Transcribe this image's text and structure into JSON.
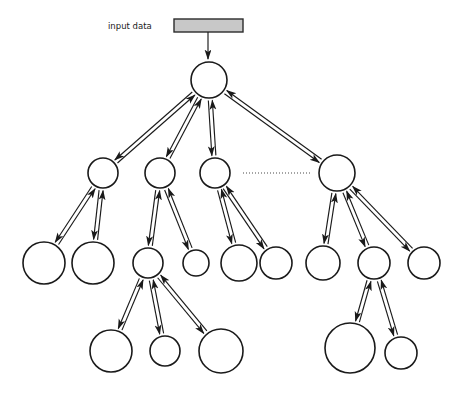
{
  "diagram": {
    "title_label": "input data",
    "colors": {
      "stroke": "#1a1a1a",
      "node_fill": "#ffffff",
      "input_bar_fill": "#c8c8c8",
      "input_bar_stroke": "#2b2b2b",
      "ellipsis_stroke": "#4a4a4a",
      "background": "#ffffff"
    },
    "input_bar": {
      "x": 174,
      "y": 19,
      "width": 69,
      "height": 13
    },
    "feed_arrow": {
      "x1": 208,
      "y1": 32,
      "x2": 208,
      "y2": 59
    },
    "ellipsis": {
      "x1": 243,
      "y1": 173,
      "x2": 311,
      "y2": 173
    },
    "nodes": [
      {
        "id": "root",
        "label": "",
        "cx": 209,
        "cy": 80,
        "r": 18,
        "level": 0
      },
      {
        "id": "l1n1",
        "label": "",
        "cx": 103,
        "cy": 173,
        "r": 15,
        "level": 1
      },
      {
        "id": "l1n2",
        "label": "",
        "cx": 160,
        "cy": 173,
        "r": 15,
        "level": 1
      },
      {
        "id": "l1n3",
        "label": "",
        "cx": 215,
        "cy": 173,
        "r": 15,
        "level": 1
      },
      {
        "id": "l1n4",
        "label": "",
        "cx": 337,
        "cy": 173,
        "r": 18,
        "level": 1
      },
      {
        "id": "l2n1",
        "label": "",
        "cx": 44,
        "cy": 263,
        "r": 21,
        "level": 2
      },
      {
        "id": "l2n2",
        "label": "",
        "cx": 93,
        "cy": 263,
        "r": 21,
        "level": 2
      },
      {
        "id": "l2n3",
        "label": "",
        "cx": 148,
        "cy": 263,
        "r": 15,
        "level": 2
      },
      {
        "id": "l2n4",
        "label": "",
        "cx": 196,
        "cy": 263,
        "r": 13,
        "level": 2
      },
      {
        "id": "l2n5",
        "label": "",
        "cx": 239,
        "cy": 263,
        "r": 18,
        "level": 2
      },
      {
        "id": "l2n6",
        "label": "",
        "cx": 276,
        "cy": 263,
        "r": 16,
        "level": 2
      },
      {
        "id": "l2n7",
        "label": "",
        "cx": 323,
        "cy": 263,
        "r": 17,
        "level": 2
      },
      {
        "id": "l2n8",
        "label": "",
        "cx": 374,
        "cy": 263,
        "r": 16,
        "level": 2
      },
      {
        "id": "l2n9",
        "label": "",
        "cx": 424,
        "cy": 263,
        "r": 16,
        "level": 2
      },
      {
        "id": "l3n1",
        "label": "",
        "cx": 111,
        "cy": 351,
        "r": 21,
        "level": 3
      },
      {
        "id": "l3n2",
        "label": "",
        "cx": 165,
        "cy": 351,
        "r": 15,
        "level": 3
      },
      {
        "id": "l3n3",
        "label": "",
        "cx": 221,
        "cy": 351,
        "r": 22,
        "level": 3
      },
      {
        "id": "l3n4",
        "label": "",
        "cx": 350,
        "cy": 348,
        "r": 25,
        "level": 3
      },
      {
        "id": "l3n5",
        "label": "",
        "cx": 401,
        "cy": 353,
        "r": 16,
        "level": 3
      }
    ],
    "edges": [
      {
        "from": "root",
        "to": "l1n1",
        "bidirectional": true
      },
      {
        "from": "root",
        "to": "l1n2",
        "bidirectional": true
      },
      {
        "from": "root",
        "to": "l1n3",
        "bidirectional": true
      },
      {
        "from": "root",
        "to": "l1n4",
        "bidirectional": true
      },
      {
        "from": "l1n1",
        "to": "l2n1",
        "bidirectional": true
      },
      {
        "from": "l1n1",
        "to": "l2n2",
        "bidirectional": true
      },
      {
        "from": "l1n2",
        "to": "l2n3",
        "bidirectional": true
      },
      {
        "from": "l1n2",
        "to": "l2n4",
        "bidirectional": true
      },
      {
        "from": "l1n3",
        "to": "l2n5",
        "bidirectional": true
      },
      {
        "from": "l1n3",
        "to": "l2n6",
        "bidirectional": true
      },
      {
        "from": "l1n4",
        "to": "l2n7",
        "bidirectional": true
      },
      {
        "from": "l1n4",
        "to": "l2n8",
        "bidirectional": true
      },
      {
        "from": "l1n4",
        "to": "l2n9",
        "bidirectional": true
      },
      {
        "from": "l2n3",
        "to": "l3n1",
        "bidirectional": true
      },
      {
        "from": "l2n3",
        "to": "l3n2",
        "bidirectional": true
      },
      {
        "from": "l2n3",
        "to": "l3n3",
        "bidirectional": true
      },
      {
        "from": "l2n8",
        "to": "l3n4",
        "bidirectional": true
      },
      {
        "from": "l2n8",
        "to": "l3n5",
        "bidirectional": true
      }
    ]
  }
}
